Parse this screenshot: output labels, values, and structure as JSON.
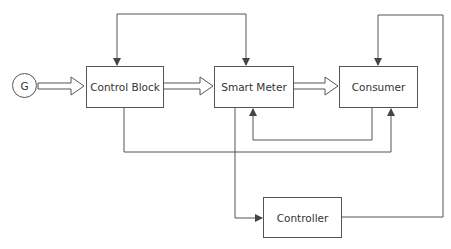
{
  "diagram": {
    "type": "block-diagram",
    "nodes": {
      "generator": {
        "label": "G"
      },
      "control_block": {
        "label": "Control Block"
      },
      "smart_meter": {
        "label": "Smart Meter"
      },
      "consumer": {
        "label": "Consumer"
      },
      "controller": {
        "label": "Controller"
      }
    },
    "edges": [
      {
        "from": "G",
        "to": "Control Block",
        "style": "double-arrow"
      },
      {
        "from": "Control Block",
        "to": "Smart Meter",
        "style": "double-arrow"
      },
      {
        "from": "Smart Meter",
        "to": "Consumer",
        "style": "double-arrow"
      },
      {
        "from": "Smart Meter",
        "to": "Control Block",
        "style": "line-arrow",
        "route": "top"
      },
      {
        "from": "Controller",
        "to": "Consumer",
        "style": "line-arrow",
        "route": "right-top"
      },
      {
        "from": "Control Block",
        "to": "Consumer",
        "style": "line-arrow",
        "route": "bottom"
      },
      {
        "from": "Consumer",
        "to": "Smart Meter",
        "style": "line-arrow",
        "route": "bottom-inner"
      },
      {
        "from": "Smart Meter",
        "to": "Controller",
        "style": "line-arrow",
        "route": "down"
      }
    ],
    "colors": {
      "line": "#555555",
      "text": "#333333",
      "background": "#ffffff"
    }
  }
}
